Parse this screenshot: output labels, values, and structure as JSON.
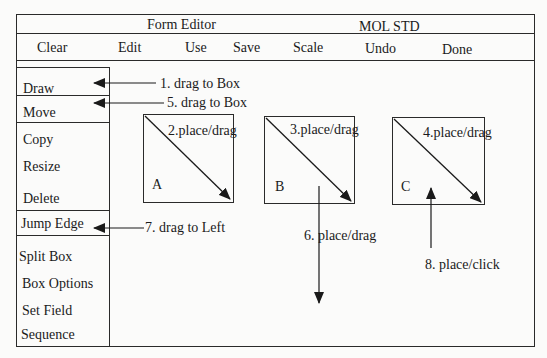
{
  "title_bar": {
    "app_title": "Form Editor",
    "document_name": "MOL  STD"
  },
  "menu_bar": {
    "items": [
      "Clear",
      "Edit",
      "Use",
      "Save",
      "Scale",
      "Undo",
      "Done"
    ]
  },
  "sidebar": {
    "items": [
      "Draw",
      "Move",
      "Copy",
      "Resize",
      "Delete",
      "Jump Edge",
      "Split Box",
      "Box Options",
      "Set Field",
      "Sequence"
    ]
  },
  "canvas": {
    "boxes": [
      {
        "label": "A",
        "annotation": "2.place/drag"
      },
      {
        "label": "B",
        "annotation": "3.place/drag"
      },
      {
        "label": "C",
        "annotation": "4.place/drag"
      }
    ]
  },
  "annotations": {
    "step1": "1. drag to Box",
    "step5": "5. drag to Box",
    "step6": "6. place/drag",
    "step7": "7. drag to Left",
    "step8": "8. place/click"
  },
  "colors": {
    "line": "#2a2a2a",
    "background": "#fbfbfa"
  }
}
